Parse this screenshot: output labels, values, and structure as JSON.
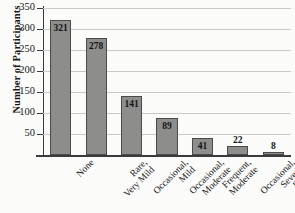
{
  "chart_data": {
    "type": "bar",
    "title": "",
    "xlabel": "",
    "ylabel": "Number of Participants",
    "ylim": [
      0,
      350
    ],
    "yticks": [
      0,
      50,
      100,
      150,
      200,
      250,
      300,
      350
    ],
    "ytick_labels": [
      "",
      "50",
      "100",
      "150",
      "200",
      "250",
      "300",
      "350"
    ],
    "grid": true,
    "legend": "none",
    "categories": [
      "None",
      "Rare, Very Mild",
      "Occasional, Mild",
      "Occasional, Moderate",
      "Frequent, Moderate",
      "Occasional, Severe",
      "Frequent, Severe"
    ],
    "category_lines": [
      [
        "None"
      ],
      [
        "Rare,",
        "Very Mild"
      ],
      [
        "Occasional,",
        "Mild"
      ],
      [
        "Occasional,",
        "Moderate"
      ],
      [
        "Frequent,",
        "Moderate"
      ],
      [
        "Occasional,",
        "Severe"
      ],
      [
        "Frequent,",
        "Severe"
      ]
    ],
    "values": [
      321,
      278,
      141,
      89,
      41,
      22,
      8
    ],
    "value_labels": [
      "321",
      "278",
      "141",
      "89",
      "41",
      "22",
      "8"
    ],
    "label_placement": [
      "inside",
      "inside",
      "inside",
      "inside",
      "inside",
      "above",
      "above"
    ],
    "bar_color": "#8d8d8b",
    "bar_edge_color": "#4a4a49",
    "grid_color": "#c9c9c6",
    "axis_color": "#3a3b3d",
    "background": "#fbfbf9"
  }
}
